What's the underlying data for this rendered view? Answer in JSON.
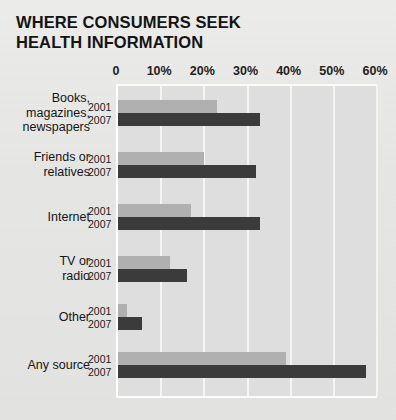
{
  "title": {
    "line1": "WHERE CONSUMERS SEEK",
    "line2": "HEALTH INFORMATION"
  },
  "colors": {
    "background": "#e6e6e4",
    "plot_background": "#dedede",
    "gridline": "#f4f4f2",
    "series_2001": "#b0b0b0",
    "series_2007": "#3b3b3b",
    "text": "#151515"
  },
  "axis": {
    "ticks": [
      "0",
      "10%",
      "20%",
      "30%",
      "40%",
      "50%",
      "60%"
    ],
    "min": 0,
    "max": 60
  },
  "series_labels": [
    "2001",
    "2007"
  ],
  "chart_data": {
    "type": "bar",
    "orientation": "horizontal",
    "title": "WHERE CONSUMERS SEEK HEALTH INFORMATION",
    "xlabel": "",
    "ylabel": "",
    "xlim": [
      0,
      60
    ],
    "xticks": [
      0,
      10,
      20,
      30,
      40,
      50,
      60
    ],
    "xticklabels": [
      "0",
      "10%",
      "20%",
      "30%",
      "40%",
      "50%",
      "60%"
    ],
    "grid": true,
    "legend": "inline-row-labels",
    "categories": [
      "Books, magazines, newspapers",
      "Friends or relatives",
      "Internet",
      "TV or radio",
      "Other",
      "Any source"
    ],
    "category_lines": [
      [
        "Books,",
        "magazines,",
        "newspapers"
      ],
      [
        "Friends or",
        "relatives"
      ],
      [
        "Internet"
      ],
      [
        "TV or",
        "radio"
      ],
      [
        "Other"
      ],
      [
        "Any source"
      ]
    ],
    "series": [
      {
        "name": "2001",
        "values": [
          23,
          20,
          17,
          12,
          2,
          39
        ]
      },
      {
        "name": "2007",
        "values": [
          33,
          32,
          33,
          16,
          5.5,
          57.5
        ]
      }
    ]
  }
}
